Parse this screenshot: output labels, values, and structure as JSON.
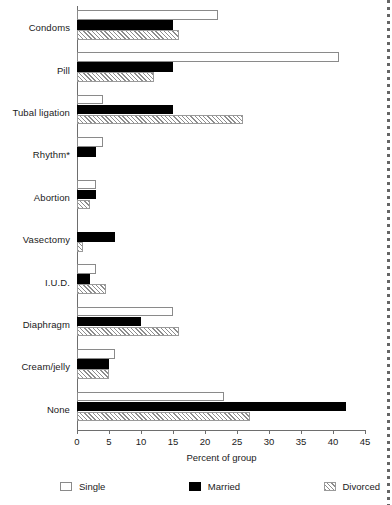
{
  "chart_data": {
    "type": "bar",
    "orientation": "horizontal",
    "title": "",
    "xlabel": "Percent of group",
    "ylabel": "",
    "xlim": [
      0,
      45
    ],
    "xticks": [
      0,
      5,
      10,
      15,
      20,
      25,
      30,
      35,
      40,
      45
    ],
    "grid": false,
    "legend_position": "bottom",
    "categories": [
      "Condoms",
      "Pill",
      "Tubal ligation",
      "Rhythm*",
      "Abortion",
      "Vasectomy",
      "I.U.D.",
      "Diaphragm",
      "Cream/jelly",
      "None"
    ],
    "series": [
      {
        "name": "Single",
        "fill": "white",
        "values": [
          22,
          41,
          4,
          4,
          3,
          0,
          3,
          15,
          6,
          23
        ]
      },
      {
        "name": "Married",
        "fill": "black",
        "values": [
          15,
          15,
          15,
          3,
          3,
          6,
          2,
          10,
          5,
          42
        ]
      },
      {
        "name": "Divorced",
        "fill": "hatched",
        "values": [
          16,
          12,
          26,
          0,
          2,
          1,
          4.5,
          16,
          5,
          27
        ]
      }
    ]
  },
  "legend": {
    "items": [
      {
        "label": "Single",
        "swatch": "swatch-single-icon"
      },
      {
        "label": "Married",
        "swatch": "swatch-married-icon"
      },
      {
        "label": "Divorced",
        "swatch": "swatch-divorced-icon"
      }
    ]
  }
}
